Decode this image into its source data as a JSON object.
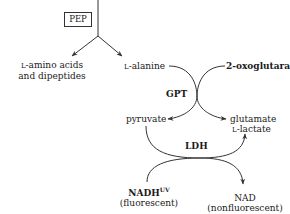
{
  "diagram": {
    "source": "PEP",
    "products": {
      "left_line1_prefix": "L",
      "left_line1": "-amino acids",
      "left_line2": "and dipeptides",
      "alanine_prefix": "L",
      "alanine": "-alanine"
    },
    "gpt_reaction": {
      "enzyme": "GPT",
      "substrate_a": "L-alanine",
      "substrate_b": "2-oxoglutarate",
      "product_a": "pyruvate",
      "product_b": "glutamate"
    },
    "ldh_reaction": {
      "enzyme": "LDH",
      "substrate": "pyruvate",
      "product_prefix": "L",
      "product": "-lactate",
      "cofactor_in": "NADH",
      "cofactor_in_sup": "UV",
      "cofactor_in_note": "(fluorescent)",
      "cofactor_out": "NAD",
      "cofactor_out_note": "(nonfluorescent)"
    }
  }
}
